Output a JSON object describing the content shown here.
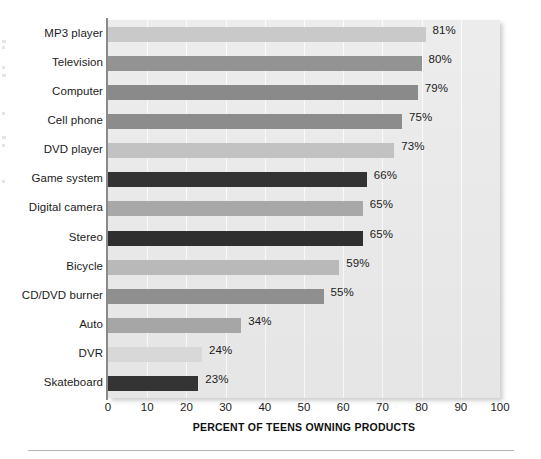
{
  "chart_data": {
    "type": "bar",
    "orientation": "horizontal",
    "title": "",
    "xlabel": "PERCENT OF TEENS OWNING PRODUCTS",
    "ylabel": "",
    "xlim": [
      0,
      100
    ],
    "xticks": [
      0,
      10,
      20,
      30,
      40,
      50,
      60,
      70,
      80,
      90,
      100
    ],
    "grid": "vertical",
    "legend": "none",
    "value_suffix": "%",
    "categories": [
      "MP3 player",
      "Television",
      "Computer",
      "Cell phone",
      "DVD player",
      "Game system",
      "Digital camera",
      "Stereo",
      "Bicycle",
      "CD/DVD burner",
      "Auto",
      "DVR",
      "Skateboard"
    ],
    "values": [
      81,
      80,
      79,
      75,
      73,
      66,
      65,
      65,
      59,
      55,
      34,
      24,
      23
    ],
    "value_labels": [
      "81%",
      "80%",
      "79%",
      "75%",
      "73%",
      "66%",
      "65%",
      "65%",
      "59%",
      "55%",
      "34%",
      "24%",
      "23%"
    ],
    "bar_colors": [
      "#c9c9c9",
      "#939393",
      "#8a8a8a",
      "#8c8c8c",
      "#c2c2c2",
      "#333333",
      "#a8a8a8",
      "#2f2f2f",
      "#b9b9b9",
      "#8f8f8f",
      "#a6a6a6",
      "#d8d8d8",
      "#343434"
    ],
    "plot_background": "#e9e9e9",
    "gridline_color": "#fbfbfb",
    "axis_color": "#8a8a8a",
    "text_color": "#1b1b1b"
  }
}
